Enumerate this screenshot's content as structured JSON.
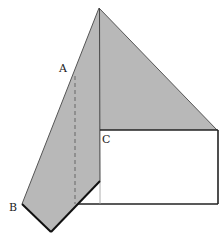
{
  "diagram": {
    "type": "folded-paper-geometry",
    "labels": {
      "A": "A",
      "B": "B",
      "C": "C"
    },
    "colors": {
      "shade": "#b8b8b8",
      "line": "#222222",
      "thin_line": "#555555",
      "faint_line": "#999999",
      "background": "#ffffff"
    },
    "points": {
      "apex": [
        99,
        8
      ],
      "right_corner": [
        217,
        130
      ],
      "C": [
        100,
        130
      ],
      "rect_bottom_right": [
        218,
        204
      ],
      "B": [
        22,
        204
      ],
      "bottom_vertex": [
        51,
        232
      ],
      "fold_meet": [
        78,
        204
      ],
      "notch": [
        100,
        181
      ],
      "A_on_edge": [
        74,
        76
      ]
    }
  }
}
